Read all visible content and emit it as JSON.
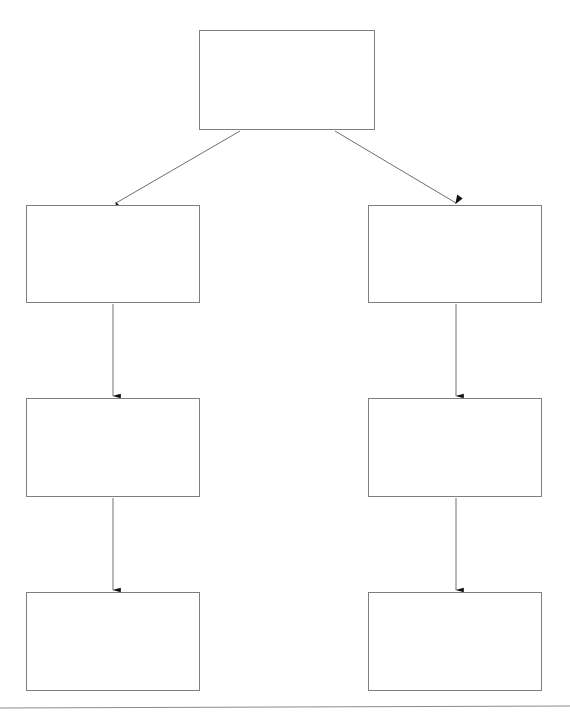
{
  "diagram": {
    "type": "flowchart",
    "orientation": "top-down",
    "canvas": {
      "width": 570,
      "height": 725,
      "background": "#ffffff"
    },
    "style": {
      "box_fill": "#ffffff",
      "box_stroke": "#7d7d82",
      "box_stroke_width": 1,
      "connector_stroke": "#6e6e73",
      "connector_stroke_width": 1,
      "arrowhead_fill": "#111111",
      "footer_rule_color": "#8a8a8f"
    },
    "nodes": [
      {
        "id": "root",
        "label": "",
        "x": 199,
        "y": 30,
        "width": 176,
        "height": 100,
        "column": "center",
        "row": 0
      },
      {
        "id": "left-1",
        "label": "",
        "x": 26,
        "y": 205,
        "width": 174,
        "height": 98,
        "column": "left",
        "row": 1
      },
      {
        "id": "right-1",
        "label": "",
        "x": 368,
        "y": 205,
        "width": 174,
        "height": 98,
        "column": "right",
        "row": 1
      },
      {
        "id": "left-2",
        "label": "",
        "x": 26,
        "y": 398,
        "width": 174,
        "height": 99,
        "column": "left",
        "row": 2
      },
      {
        "id": "right-2",
        "label": "",
        "x": 368,
        "y": 398,
        "width": 174,
        "height": 99,
        "column": "right",
        "row": 2
      },
      {
        "id": "left-3",
        "label": "",
        "x": 26,
        "y": 592,
        "width": 174,
        "height": 99,
        "column": "left",
        "row": 3
      },
      {
        "id": "right-3",
        "label": "",
        "x": 368,
        "y": 592,
        "width": 174,
        "height": 99,
        "column": "right",
        "row": 3
      }
    ],
    "edges": [
      {
        "id": "edge-root-left-1",
        "from": "root",
        "to": "left-1",
        "kind": "diagonal",
        "label": "",
        "x1": 240,
        "y1": 131,
        "x2": 116,
        "y2": 203
      },
      {
        "id": "edge-root-right-1",
        "from": "root",
        "to": "right-1",
        "kind": "diagonal",
        "label": "",
        "x1": 335,
        "y1": 131,
        "x2": 456,
        "y2": 203
      },
      {
        "id": "edge-left-1-left-2",
        "from": "left-1",
        "to": "left-2",
        "kind": "vertical",
        "label": "",
        "x1": 113,
        "y1": 304,
        "x2": 113,
        "y2": 396
      },
      {
        "id": "edge-right-1-right-2",
        "from": "right-1",
        "to": "right-2",
        "kind": "vertical",
        "label": "",
        "x1": 456,
        "y1": 304,
        "x2": 456,
        "y2": 396
      },
      {
        "id": "edge-left-2-left-3",
        "from": "left-2",
        "to": "left-3",
        "kind": "vertical",
        "label": "",
        "x1": 113,
        "y1": 498,
        "x2": 113,
        "y2": 590
      },
      {
        "id": "edge-right-2-right-3",
        "from": "right-2",
        "to": "right-3",
        "kind": "vertical",
        "label": "",
        "x1": 456,
        "y1": 498,
        "x2": 456,
        "y2": 590
      }
    ],
    "footer_rule": {
      "x1": 0,
      "y1": 708,
      "x2": 570,
      "y2": 706
    }
  }
}
